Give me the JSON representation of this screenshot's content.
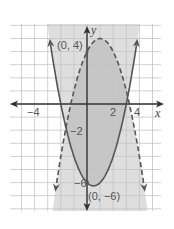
{
  "chart_data": {
    "type": "line",
    "title": "",
    "xlabel": "x",
    "ylabel": "y",
    "xlim": [
      -6,
      5.6
    ],
    "ylim": [
      -8.2,
      6.1
    ],
    "grid": true,
    "x_tick_labels": [
      {
        "value": -4,
        "label": "−4"
      },
      {
        "value": 2,
        "label": "2"
      },
      {
        "value": 4,
        "label": "4"
      }
    ],
    "y_tick_labels": [
      {
        "value": -2,
        "label": "−2"
      },
      {
        "value": -6,
        "label": "−6"
      }
    ],
    "series": [
      {
        "name": "solid-parabola",
        "equation": "y = x^2 - x - 6",
        "style": "solid",
        "inequality": "y >= x^2 - x - 6",
        "x": [
          -2.8,
          -2,
          -1,
          0,
          0.5,
          1,
          2,
          3,
          3.8
        ],
        "y": [
          4.64,
          0,
          -4,
          -6,
          -6.25,
          -6,
          -4,
          0,
          4.64
        ]
      },
      {
        "name": "dashed-parabola",
        "equation": "y = -x^2 + 2x + 4",
        "style": "dashed",
        "inequality": "y < -x^2 + 2x + 4",
        "x": [
          -2.4,
          -2,
          -1,
          0,
          1,
          2,
          3,
          4,
          4.4
        ],
        "y": [
          -6.56,
          -4,
          1,
          4,
          5,
          4,
          1,
          -4,
          -6.56
        ]
      }
    ],
    "annotations": [
      {
        "label": "(0, 4)",
        "x": 0,
        "y": 4
      },
      {
        "label": "(0, −6)",
        "x": 0,
        "y": -6
      }
    ],
    "shading": {
      "light": "#dedede",
      "dark": "#c6c6c6",
      "description": "union of solution regions lightly shaded; intersection darker"
    }
  },
  "labels": {
    "x_axis": "x",
    "y_axis": "y",
    "tick_neg4": "−4",
    "tick_2": "2",
    "tick_4": "4",
    "tick_neg2": "−2",
    "tick_neg6": "−6",
    "point_top": "(0, 4)",
    "point_bottom": "(0, −6)"
  },
  "colors": {
    "curve": "#555555",
    "grid": "#c8c8c8",
    "axis": "#333333"
  }
}
